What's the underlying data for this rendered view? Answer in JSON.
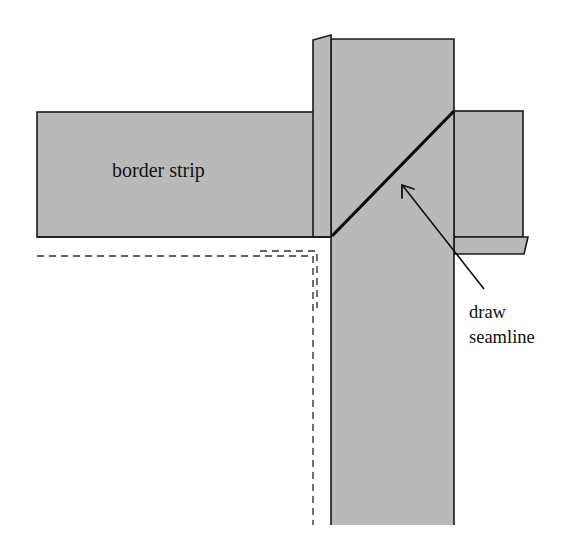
{
  "diagram": {
    "title": "",
    "labels": {
      "border_strip": "border strip",
      "callout_line1": "draw",
      "callout_line2": "seamline"
    },
    "colors": {
      "fabric_fill": "#b9b9b9",
      "outline": "#1a1a1a",
      "seamline": "#0a0a0a",
      "dashed_guide": "#333333",
      "background": "#ffffff"
    },
    "elements": [
      "horizontal border strip",
      "vertical border strip (overlapping)",
      "folded seam allowance flap (top-left of vertical strip)",
      "folded seam allowance flap (bottom-right of horizontal strip extension)",
      "diagonal mitered seamline",
      "arrow pointing to seamline",
      "dashed quilt-edge guide lines"
    ]
  }
}
